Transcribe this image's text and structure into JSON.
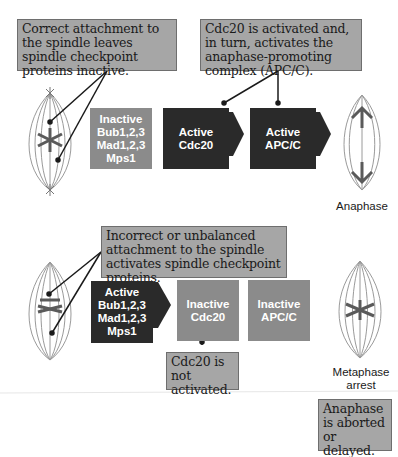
{
  "top_pathway": {
    "callout_left": "Correct attachment to the spindle leaves spindle checkpoint proteins inactive.",
    "callout_right": "Cdc20 is activated and, in turn, activates the anaphase-promoting complex (APC/C).",
    "boxes": [
      {
        "text": "Inactive\nBub1,2,3\nMad1,2,3\nMps1",
        "state": "inactive"
      },
      {
        "text": "Active\nCdc20",
        "state": "active"
      },
      {
        "text": "Active\nAPC/C",
        "state": "active"
      }
    ],
    "cell_label": "Anaphase"
  },
  "bottom_pathway": {
    "callout_top": "Incorrect or unbalanced attachment to the spindle activates spindle checkpoint proteins.",
    "callout_cdc20": "Cdc20 is not activated.",
    "callout_outcome": "Anaphase is aborted or delayed.",
    "boxes": [
      {
        "text": "Active\nBub1,2,3\nMad1,2,3\nMps1",
        "state": "active"
      },
      {
        "text": "Inactive\nCdc20",
        "state": "inactive"
      },
      {
        "text": "Inactive\nAPC/C",
        "state": "inactive"
      }
    ],
    "cell_label": "Metaphase\narrest"
  },
  "colors": {
    "active_box": "#2a2a2a",
    "inactive_box": "#8b8b8b",
    "callout_bg": "#a6a6a6"
  }
}
